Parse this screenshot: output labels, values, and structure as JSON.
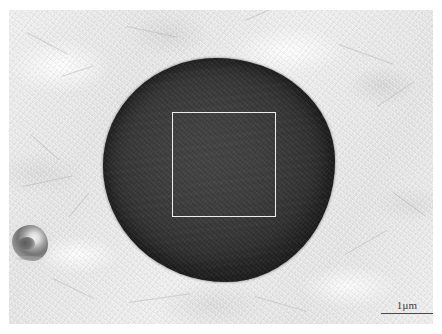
{
  "figure": {
    "type": "sem-micrograph",
    "name": "grayscale-electron-micrograph",
    "background_color": "#ffffff",
    "field": {
      "matrix_color": "#e9e9e9",
      "left": 9,
      "top": 10,
      "width": 424,
      "height": 314
    }
  },
  "features": {
    "primary_particle": {
      "label": "large-dark-spherical-particle",
      "fill_color": "#3a3a3a",
      "rim_color": "#262626",
      "left": 103,
      "top": 58,
      "width": 232,
      "height": 224
    },
    "roi": {
      "label": "analysis-region-of-interest",
      "stroke_color": "#eeeeee",
      "left": 172,
      "top": 112,
      "width": 104,
      "height": 105
    },
    "secondary_particle": {
      "label": "small-irregular-particle",
      "left": 12,
      "top": 225,
      "width": 36,
      "height": 36
    }
  },
  "scale_bar": {
    "label": "1μm",
    "value": 1,
    "unit": "μm",
    "rule_color": "#4a4a4a",
    "bar_length_px": 52
  },
  "striations": [
    {
      "left": 18,
      "top": 22,
      "length": 46,
      "angle": 28,
      "thickness": 1
    },
    {
      "left": 52,
      "top": 66,
      "length": 34,
      "angle": -18,
      "thickness": 1
    },
    {
      "left": 118,
      "top": 16,
      "length": 52,
      "angle": 12,
      "thickness": 1
    },
    {
      "left": 236,
      "top": 10,
      "length": 40,
      "angle": -24,
      "thickness": 1
    },
    {
      "left": 330,
      "top": 34,
      "length": 58,
      "angle": 20,
      "thickness": 1
    },
    {
      "left": 368,
      "top": 96,
      "length": 44,
      "angle": -34,
      "thickness": 1
    },
    {
      "left": 22,
      "top": 124,
      "length": 38,
      "angle": 42,
      "thickness": 1
    },
    {
      "left": 14,
      "top": 176,
      "length": 50,
      "angle": -12,
      "thickness": 1
    },
    {
      "left": 44,
      "top": 268,
      "length": 46,
      "angle": 26,
      "thickness": 1
    },
    {
      "left": 120,
      "top": 292,
      "length": 62,
      "angle": -8,
      "thickness": 1
    },
    {
      "left": 246,
      "top": 286,
      "length": 54,
      "angle": 16,
      "thickness": 1
    },
    {
      "left": 336,
      "top": 244,
      "length": 48,
      "angle": -30,
      "thickness": 1
    },
    {
      "left": 384,
      "top": 182,
      "length": 40,
      "angle": 36,
      "thickness": 1
    },
    {
      "left": 60,
      "top": 206,
      "length": 30,
      "angle": -50,
      "thickness": 1
    }
  ]
}
